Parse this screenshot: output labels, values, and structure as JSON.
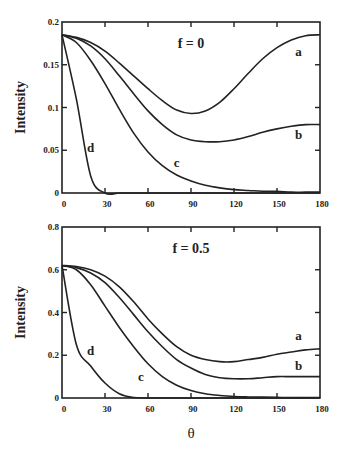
{
  "chart_data": [
    {
      "type": "line",
      "title": "f = 0",
      "xlabel": "",
      "ylabel": "Intensity",
      "xlim": [
        0,
        180
      ],
      "ylim": [
        0,
        0.2
      ],
      "xticks": [
        0,
        30,
        60,
        90,
        120,
        150,
        180
      ],
      "yticks": [
        0,
        0.05,
        0.1,
        0.15,
        0.2
      ],
      "xtick_labels": [
        "0",
        "30",
        "60",
        "90",
        "120",
        "150",
        "180"
      ],
      "ytick_labels": [
        "0",
        "0.05",
        "0.1",
        "0.15",
        "0.2"
      ],
      "grid": false,
      "x": [
        0,
        10,
        20,
        30,
        40,
        50,
        60,
        70,
        80,
        90,
        100,
        110,
        120,
        130,
        140,
        150,
        160,
        170,
        180
      ],
      "series": [
        {
          "name": "a",
          "values": [
            0.185,
            0.182,
            0.176,
            0.166,
            0.152,
            0.137,
            0.122,
            0.108,
            0.097,
            0.093,
            0.096,
            0.106,
            0.122,
            0.14,
            0.157,
            0.17,
            0.179,
            0.184,
            0.185
          ]
        },
        {
          "name": "b",
          "values": [
            0.185,
            0.181,
            0.172,
            0.157,
            0.137,
            0.116,
            0.096,
            0.08,
            0.068,
            0.062,
            0.06,
            0.06,
            0.062,
            0.066,
            0.071,
            0.075,
            0.078,
            0.08,
            0.08
          ]
        },
        {
          "name": "c",
          "values": [
            0.185,
            0.176,
            0.155,
            0.128,
            0.098,
            0.07,
            0.048,
            0.032,
            0.021,
            0.014,
            0.009,
            0.006,
            0.004,
            0.003,
            0.002,
            0.002,
            0.001,
            0.001,
            0.001
          ]
        },
        {
          "name": "d",
          "values": [
            0.185,
            0.11,
            0.02,
            0.0,
            0.0,
            0.0,
            0.0,
            0.0,
            0.0,
            0.0,
            0.0,
            0.0,
            0.0,
            0.0,
            0.0,
            0.0,
            0.0,
            0.0,
            0.0
          ]
        }
      ],
      "annotations": [
        {
          "text": "f = 0",
          "x": 90,
          "y": 0.17
        },
        {
          "text": "a",
          "x": 165,
          "y": 0.16
        },
        {
          "text": "b",
          "x": 165,
          "y": 0.063
        },
        {
          "text": "c",
          "x": 80,
          "y": 0.03
        },
        {
          "text": "d",
          "x": 20,
          "y": 0.048
        }
      ]
    },
    {
      "type": "line",
      "title": "f = 0.5",
      "xlabel": "θ",
      "ylabel": "Intensity",
      "xlim": [
        0,
        180
      ],
      "ylim": [
        0,
        0.8
      ],
      "xticks": [
        0,
        30,
        60,
        90,
        120,
        150,
        180
      ],
      "yticks": [
        0,
        0.2,
        0.4,
        0.6,
        0.8
      ],
      "xtick_labels": [
        "0",
        "30",
        "60",
        "90",
        "120",
        "150",
        "180"
      ],
      "ytick_labels": [
        "0",
        "0.2",
        "0.4",
        "0.6",
        "0.8"
      ],
      "grid": false,
      "x": [
        0,
        10,
        20,
        30,
        40,
        50,
        60,
        70,
        80,
        90,
        100,
        110,
        120,
        130,
        140,
        150,
        160,
        170,
        180
      ],
      "series": [
        {
          "name": "a",
          "values": [
            0.62,
            0.615,
            0.6,
            0.57,
            0.52,
            0.45,
            0.37,
            0.3,
            0.24,
            0.2,
            0.18,
            0.17,
            0.17,
            0.18,
            0.19,
            0.205,
            0.215,
            0.225,
            0.23
          ]
        },
        {
          "name": "b",
          "values": [
            0.62,
            0.61,
            0.585,
            0.54,
            0.47,
            0.39,
            0.31,
            0.24,
            0.18,
            0.14,
            0.11,
            0.095,
            0.09,
            0.09,
            0.095,
            0.1,
            0.1,
            0.1,
            0.1
          ]
        },
        {
          "name": "c",
          "values": [
            0.62,
            0.6,
            0.53,
            0.43,
            0.33,
            0.24,
            0.16,
            0.1,
            0.06,
            0.035,
            0.02,
            0.012,
            0.007,
            0.005,
            0.004,
            0.003,
            0.002,
            0.002,
            0.002
          ]
        },
        {
          "name": "d",
          "values": [
            0.62,
            0.25,
            0.15,
            0.07,
            0.02,
            0.002,
            0.0,
            0.0,
            0.0,
            0.0,
            0.0,
            0.0,
            0.0,
            0.0,
            0.0,
            0.0,
            0.0,
            0.0,
            0.0
          ]
        }
      ],
      "annotations": [
        {
          "text": "f = 0.5",
          "x": 90,
          "y": 0.68
        },
        {
          "text": "a",
          "x": 165,
          "y": 0.27
        },
        {
          "text": "b",
          "x": 165,
          "y": 0.13
        },
        {
          "text": "c",
          "x": 55,
          "y": 0.08
        },
        {
          "text": "d",
          "x": 20,
          "y": 0.2
        }
      ]
    }
  ],
  "labels": {
    "top_title": "f = 0",
    "bottom_title": "f = 0.5",
    "ylabel": "Intensity",
    "xlabel": "θ"
  }
}
